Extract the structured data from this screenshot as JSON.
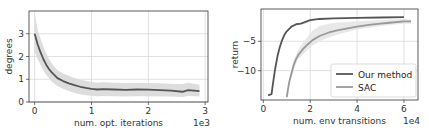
{
  "chart_data": [
    {
      "type": "line",
      "title": "",
      "xlabel": "num. opt. iterations",
      "ylabel": "degrees",
      "x_offset_label": "1e3",
      "xticks": [
        0,
        1,
        2,
        3
      ],
      "yticks": [
        0,
        1,
        2,
        3
      ],
      "xlim": [
        -0.1,
        3.05
      ],
      "ylim": [
        0,
        4.0
      ],
      "grid": true,
      "legend": null,
      "series": [
        {
          "name": "degrees",
          "color": "#555555",
          "band_color": "#d9d9d9",
          "x": [
            0,
            0.05,
            0.1,
            0.15,
            0.2,
            0.25,
            0.3,
            0.4,
            0.5,
            0.6,
            0.7,
            0.8,
            0.9,
            1.0,
            1.1,
            1.2,
            1.4,
            1.6,
            1.8,
            2.0,
            2.2,
            2.4,
            2.6,
            2.7,
            2.8,
            2.9
          ],
          "values": [
            3.0,
            2.55,
            2.2,
            1.9,
            1.65,
            1.45,
            1.3,
            1.05,
            0.92,
            0.82,
            0.74,
            0.67,
            0.62,
            0.58,
            0.55,
            0.57,
            0.55,
            0.53,
            0.55,
            0.54,
            0.52,
            0.5,
            0.45,
            0.52,
            0.5,
            0.48
          ],
          "lower": [
            2.2,
            1.9,
            1.65,
            1.4,
            1.2,
            1.05,
            0.9,
            0.7,
            0.58,
            0.48,
            0.4,
            0.34,
            0.3,
            0.27,
            0.25,
            0.26,
            0.25,
            0.24,
            0.25,
            0.25,
            0.24,
            0.24,
            0.22,
            0.26,
            0.25,
            0.24
          ],
          "upper": [
            3.9,
            3.2,
            2.8,
            2.45,
            2.15,
            1.9,
            1.7,
            1.4,
            1.25,
            1.15,
            1.05,
            0.98,
            0.93,
            0.88,
            0.85,
            0.87,
            0.85,
            0.83,
            0.85,
            0.84,
            0.82,
            0.8,
            0.78,
            0.85,
            0.8,
            0.76
          ]
        }
      ]
    },
    {
      "type": "line",
      "title": "",
      "xlabel": "num. env transitions",
      "ylabel": "return",
      "x_offset_label": "1e4",
      "xticks": [
        0,
        2,
        4,
        6
      ],
      "yticks": [
        -10,
        -5
      ],
      "xlim": [
        -0.1,
        6.6
      ],
      "ylim": [
        -15.0,
        0.5
      ],
      "grid": true,
      "legend": {
        "position": "lower right",
        "entries": [
          "Our method",
          "SAC"
        ]
      },
      "series": [
        {
          "name": "Our method",
          "color": "#555555",
          "x": [
            0.2,
            0.35,
            0.4,
            0.5,
            0.6,
            0.7,
            0.8,
            0.9,
            1.0,
            1.2,
            1.4,
            1.6,
            1.8,
            2.0,
            2.4,
            3.0,
            4.0,
            5.0,
            6.0
          ],
          "values": [
            -14.2,
            -14.0,
            -12.5,
            -9.8,
            -7.6,
            -6.0,
            -4.8,
            -3.9,
            -3.3,
            -2.5,
            -2.1,
            -2.0,
            -1.7,
            -1.4,
            -1.2,
            -1.1,
            -1.0,
            -0.95,
            -0.9
          ]
        },
        {
          "name": "SAC",
          "color": "#999999",
          "band_color": "#e6e6e6",
          "x": [
            1.0,
            1.1,
            1.2,
            1.3,
            1.4,
            1.5,
            1.7,
            1.9,
            2.1,
            2.4,
            2.8,
            3.2,
            3.6,
            4.0,
            4.5,
            5.0,
            5.5,
            6.0,
            6.3
          ],
          "values": [
            -14.5,
            -12.0,
            -10.5,
            -9.0,
            -8.0,
            -7.3,
            -6.3,
            -5.5,
            -4.8,
            -4.1,
            -3.5,
            -3.1,
            -2.8,
            -2.5,
            -2.2,
            -2.0,
            -1.8,
            -1.6,
            -1.6
          ],
          "lower": [
            -14.5,
            -12.5,
            -11.2,
            -9.8,
            -8.8,
            -8.0,
            -7.2,
            -6.4,
            -5.7,
            -5.0,
            -4.3,
            -3.8,
            -3.4,
            -3.0,
            -2.7,
            -2.4,
            -2.2,
            -2.0,
            -2.0
          ],
          "upper": [
            -14.5,
            -11.4,
            -9.8,
            -8.2,
            -7.2,
            -6.4,
            -5.2,
            -4.2,
            -3.2,
            -2.4,
            -2.0,
            -1.8,
            -1.7,
            -1.6,
            -1.5,
            -1.4,
            -1.3,
            -1.2,
            -1.3
          ]
        }
      ]
    }
  ]
}
